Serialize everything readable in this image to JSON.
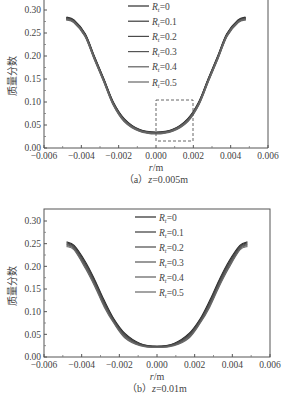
{
  "chart_data": [
    {
      "type": "line",
      "panel": "a",
      "caption": "（a）z=0.005m",
      "caption_prefix": "（a）",
      "caption_var": "z",
      "caption_value": "=0.005m",
      "xlabel": "r/m",
      "xlabel_var": "r",
      "xlabel_unit": "/m",
      "ylabel": "质量分数",
      "xlim": [
        -0.006,
        0.006
      ],
      "ylim": [
        0.0,
        0.3
      ],
      "xticks": [
        "-0.006",
        "-0.004",
        "-0.002",
        "0.000",
        "0.002",
        "0.004",
        "0.006"
      ],
      "yticks": [
        "0.00",
        "0.05",
        "0.10",
        "0.15",
        "0.20",
        "0.25",
        "0.30"
      ],
      "grid": false,
      "legend_position": "upper center",
      "annotation": {
        "type": "dashed-rectangle",
        "x_range": [
          0.0,
          0.002
        ],
        "y_range": [
          0.015,
          0.105
        ]
      },
      "x": [
        -0.0048,
        -0.0044,
        -0.0038,
        -0.0033,
        -0.0028,
        -0.0023,
        -0.0017,
        -0.0009,
        0.0,
        0.0009,
        0.0017,
        0.0023,
        0.0028,
        0.0033,
        0.0038,
        0.0044,
        0.0048
      ],
      "series": [
        {
          "name": "Rt=0",
          "sub": "t",
          "label_tail": "=0",
          "color": "#2a2a2a",
          "values": [
            0.284,
            0.278,
            0.248,
            0.198,
            0.15,
            0.1,
            0.063,
            0.04,
            0.034,
            0.04,
            0.063,
            0.1,
            0.15,
            0.198,
            0.248,
            0.278,
            0.284
          ]
        },
        {
          "name": "Rt=0.1",
          "sub": "t",
          "label_tail": "=0.1",
          "color": "#3a3a3a",
          "values": [
            0.283,
            0.277,
            0.247,
            0.197,
            0.149,
            0.099,
            0.062,
            0.039,
            0.033,
            0.039,
            0.062,
            0.099,
            0.149,
            0.197,
            0.247,
            0.277,
            0.283
          ]
        },
        {
          "name": "Rt=0.2",
          "sub": "t",
          "label_tail": "=0.2",
          "color": "#4a4a4a",
          "values": [
            0.282,
            0.276,
            0.246,
            0.196,
            0.148,
            0.098,
            0.061,
            0.039,
            0.033,
            0.039,
            0.061,
            0.098,
            0.148,
            0.196,
            0.246,
            0.276,
            0.282
          ]
        },
        {
          "name": "Rt=0.3",
          "sub": "t",
          "label_tail": "=0.3",
          "color": "#555555",
          "values": [
            0.281,
            0.275,
            0.245,
            0.195,
            0.147,
            0.097,
            0.06,
            0.038,
            0.032,
            0.038,
            0.06,
            0.097,
            0.147,
            0.195,
            0.245,
            0.275,
            0.281
          ]
        },
        {
          "name": "Rt=0.4",
          "sub": "t",
          "label_tail": "=0.4",
          "color": "#5e5e5e",
          "values": [
            0.28,
            0.274,
            0.244,
            0.194,
            0.146,
            0.096,
            0.059,
            0.038,
            0.032,
            0.038,
            0.059,
            0.096,
            0.146,
            0.194,
            0.244,
            0.274,
            0.28
          ]
        },
        {
          "name": "Rt=0.5",
          "sub": "t",
          "label_tail": "=0.5",
          "color": "#666666",
          "values": [
            0.279,
            0.273,
            0.243,
            0.193,
            0.145,
            0.095,
            0.058,
            0.037,
            0.031,
            0.037,
            0.058,
            0.095,
            0.145,
            0.193,
            0.243,
            0.273,
            0.279
          ]
        }
      ]
    },
    {
      "type": "line",
      "panel": "b",
      "caption": "（b）z=0.01m",
      "caption_prefix": "（b）",
      "caption_var": "z",
      "caption_value": "=0.01m",
      "xlabel": "r/m",
      "xlabel_var": "r",
      "xlabel_unit": "/m",
      "ylabel": "质量分数",
      "xlim": [
        -0.006,
        0.006
      ],
      "ylim": [
        0.0,
        0.3
      ],
      "xticks": [
        "-0.006",
        "-0.004",
        "-0.002",
        "0.000",
        "0.002",
        "0.004",
        "0.006"
      ],
      "yticks": [
        "0.00",
        "0.05",
        "0.10",
        "0.15",
        "0.20",
        "0.25",
        "0.30"
      ],
      "grid": false,
      "legend_position": "upper center",
      "x": [
        -0.0048,
        -0.0044,
        -0.0038,
        -0.0033,
        -0.0028,
        -0.0023,
        -0.0017,
        -0.0009,
        0.0,
        0.0009,
        0.0017,
        0.0023,
        0.0028,
        0.0033,
        0.0038,
        0.0044,
        0.0048
      ],
      "series": [
        {
          "name": "Rt=0",
          "sub": "t",
          "label_tail": "=0",
          "color": "#2a2a2a",
          "values": [
            0.254,
            0.246,
            0.21,
            0.17,
            0.125,
            0.085,
            0.052,
            0.03,
            0.024,
            0.03,
            0.052,
            0.085,
            0.125,
            0.17,
            0.21,
            0.246,
            0.254
          ]
        },
        {
          "name": "Rt=0.1",
          "sub": "t",
          "label_tail": "=0.1",
          "color": "#3a3a3a",
          "values": [
            0.252,
            0.244,
            0.207,
            0.167,
            0.122,
            0.083,
            0.05,
            0.029,
            0.023,
            0.029,
            0.05,
            0.083,
            0.122,
            0.167,
            0.207,
            0.244,
            0.252
          ]
        },
        {
          "name": "Rt=0.2",
          "sub": "t",
          "label_tail": "=0.2",
          "color": "#4a4a4a",
          "values": [
            0.25,
            0.242,
            0.204,
            0.164,
            0.119,
            0.081,
            0.048,
            0.028,
            0.023,
            0.028,
            0.048,
            0.081,
            0.119,
            0.164,
            0.204,
            0.242,
            0.25
          ]
        },
        {
          "name": "Rt=0.3",
          "sub": "t",
          "label_tail": "=0.3",
          "color": "#555555",
          "values": [
            0.248,
            0.24,
            0.201,
            0.161,
            0.116,
            0.079,
            0.046,
            0.027,
            0.022,
            0.027,
            0.046,
            0.079,
            0.116,
            0.161,
            0.201,
            0.24,
            0.248
          ]
        },
        {
          "name": "Rt=0.4",
          "sub": "t",
          "label_tail": "=0.4",
          "color": "#5e5e5e",
          "values": [
            0.246,
            0.238,
            0.198,
            0.158,
            0.113,
            0.077,
            0.044,
            0.026,
            0.022,
            0.026,
            0.044,
            0.077,
            0.113,
            0.158,
            0.198,
            0.238,
            0.246
          ]
        },
        {
          "name": "Rt=0.5",
          "sub": "t",
          "label_tail": "=0.5",
          "color": "#666666",
          "values": [
            0.244,
            0.236,
            0.195,
            0.155,
            0.11,
            0.075,
            0.042,
            0.025,
            0.021,
            0.025,
            0.042,
            0.075,
            0.11,
            0.155,
            0.195,
            0.236,
            0.244
          ]
        }
      ]
    }
  ]
}
